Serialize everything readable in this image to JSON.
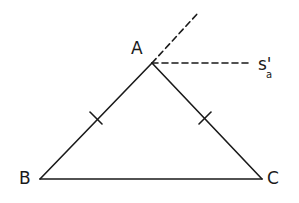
{
  "diagram": {
    "type": "geometry",
    "colors": {
      "stroke": "#1a1a1a",
      "background": "#ffffff"
    },
    "vertices": {
      "A": {
        "label": "A",
        "x": 152,
        "y": 63
      },
      "B": {
        "label": "B",
        "x": 40,
        "y": 179
      },
      "C": {
        "label": "C",
        "x": 262,
        "y": 179
      }
    },
    "segments": [
      {
        "name": "AB",
        "from": "A",
        "to": "B",
        "style": "solid",
        "tick_marks": 1
      },
      {
        "name": "AC",
        "from": "A",
        "to": "C",
        "style": "solid",
        "tick_marks": 1
      },
      {
        "name": "BC",
        "from": "B",
        "to": "C",
        "style": "solid",
        "tick_marks": 0
      }
    ],
    "extensions": [
      {
        "name": "BA-extension",
        "from": "A",
        "to": {
          "x": 198,
          "y": 13
        },
        "style": "dashed"
      },
      {
        "name": "external-bisector",
        "from": "A",
        "to": {
          "x": 250,
          "y": 63
        },
        "style": "dashed",
        "label": "s'",
        "subscript": "a"
      }
    ],
    "labels": {
      "A": "A",
      "B": "B",
      "C": "C",
      "bisector_main": "s'",
      "bisector_sub": "a"
    }
  }
}
